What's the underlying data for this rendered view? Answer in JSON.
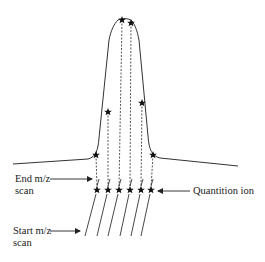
{
  "figure": {
    "type": "diagram",
    "colors": {
      "line": "#333333",
      "star": "#111111",
      "text": "#222222",
      "background": "#ffffff"
    }
  },
  "labels": {
    "end_scan_line1": "End m/z",
    "end_scan_line2": "scan",
    "start_scan_line1": "Start m/z",
    "start_scan_line2": "scan",
    "quant_ion": "Quantition ion"
  },
  "peak": {
    "baseline_left": [
      13,
      164
    ],
    "baseline_right": [
      238,
      166
    ],
    "apex": [
      126,
      19
    ],
    "sample_points": [
      {
        "name": "base-left",
        "x": 96,
        "y": 155
      },
      {
        "name": "mid-left",
        "x": 108,
        "y": 112
      },
      {
        "name": "apex-left",
        "x": 122,
        "y": 20
      },
      {
        "name": "apex-right",
        "x": 131,
        "y": 23
      },
      {
        "name": "mid-right",
        "x": 142,
        "y": 103
      },
      {
        "name": "base-right",
        "x": 153,
        "y": 155
      }
    ]
  },
  "quant_points": [
    {
      "x": 97,
      "y": 190
    },
    {
      "x": 108,
      "y": 190
    },
    {
      "x": 119,
      "y": 190
    },
    {
      "x": 130,
      "y": 190
    },
    {
      "x": 141,
      "y": 190
    },
    {
      "x": 151,
      "y": 190
    }
  ],
  "scan_count": 6
}
